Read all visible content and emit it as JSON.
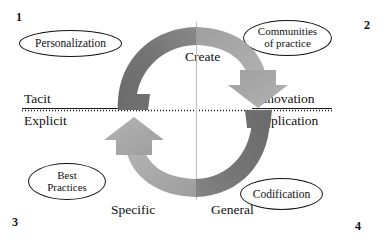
{
  "diagram": {
    "background_color": "#ffffff",
    "text_color": "#111111"
  },
  "axes": {
    "vertical_axis": {
      "name": "knowledge-form-axis",
      "top_label": "Tacit",
      "bottom_label": "Explicit",
      "right_top_label": "Innovation",
      "right_bottom_label": "Replication",
      "style": "dotted",
      "color": "#1a1a1a"
    },
    "horizontal_axis": {
      "name": "knowledge-scope-axis",
      "left_label": "Specific",
      "right_label": "General",
      "style": "solid-light",
      "color": "#bdbdbd"
    },
    "left_rule_color": "#1a1a1a"
  },
  "quadrant_numbers": {
    "top_left": "1",
    "top_right": "2",
    "bottom_left": "3",
    "bottom_right": "4"
  },
  "nodes": [
    {
      "id": "personalization",
      "label": "Personalization",
      "lines": [
        "Personalization"
      ],
      "quadrant": "1",
      "shape": "ellipse",
      "stroke": "#141414",
      "fill": "#ffffff"
    },
    {
      "id": "communities-of-practice",
      "label": "Communities of practice",
      "lines": [
        "Communities",
        "of practice"
      ],
      "quadrant": "2",
      "shape": "ellipse",
      "stroke": "#141414",
      "fill": "#ffffff"
    },
    {
      "id": "best-practices",
      "label": "Best Practices",
      "lines": [
        "Best",
        "Practices"
      ],
      "quadrant": "3",
      "shape": "ellipse",
      "stroke": "#141414",
      "fill": "#ffffff"
    },
    {
      "id": "codification",
      "label": "Codification",
      "lines": [
        "Codification"
      ],
      "quadrant": "4",
      "shape": "ellipse",
      "stroke": "#141414",
      "fill": "#ffffff"
    }
  ],
  "cycle": {
    "name": "knowledge-cycle-loop",
    "arrows": [
      {
        "id": "create",
        "label": "Create",
        "direction": "clockwise-downward",
        "color_dark": "#6f6f6f",
        "color_light": "#a9a9a9"
      },
      {
        "id": "share",
        "label": "Share",
        "direction": "counter-clockwise-upward",
        "color_dark": "#6f6f6f",
        "color_light": "#a9a9a9"
      }
    ],
    "colors": {
      "dark_gray": "#6f6f6f",
      "light_gray": "#a9a9a9",
      "mid_gray": "#8d8d8d"
    }
  }
}
